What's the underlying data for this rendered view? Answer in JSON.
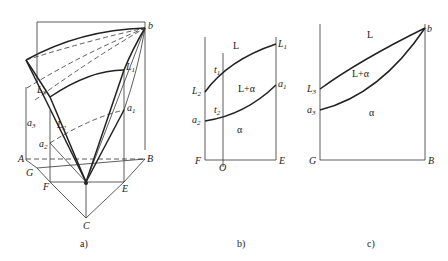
{
  "figure": {
    "panels": [
      {
        "id": "a",
        "caption": "a)",
        "points": {
          "b": "b",
          "L1": "L",
          "L1_sub": "1",
          "L2": "L",
          "L2_sub": "2",
          "L3": "L",
          "L3_sub": "3",
          "a1": "a",
          "a1_sub": "1",
          "a2": "a",
          "a2_sub": "2",
          "a3": "a",
          "a3_sub": "3",
          "A": "A",
          "B": "B",
          "C": "C",
          "E": "E",
          "F": "F",
          "G": "G"
        }
      },
      {
        "id": "b",
        "caption": "b)",
        "regions": {
          "L": "L",
          "L_alpha": "L+α",
          "alpha": "α"
        },
        "points": {
          "L1": "L",
          "L1_sub": "1",
          "L2": "L",
          "L2_sub": "2",
          "a1": "a",
          "a1_sub": "1",
          "a2": "a",
          "a2_sub": "2",
          "t1": "t",
          "t1_sub": "1",
          "t2": "t",
          "t2_sub": "2",
          "F": "F",
          "O": "O",
          "E": "E"
        }
      },
      {
        "id": "c",
        "caption": "c)",
        "regions": {
          "L": "L",
          "L_alpha": "L+α",
          "alpha": "α"
        },
        "points": {
          "b": "b",
          "L3": "L",
          "L3_sub": "3",
          "a3": "a",
          "a3_sub": "3",
          "G": "G",
          "B": "B"
        }
      }
    ]
  }
}
